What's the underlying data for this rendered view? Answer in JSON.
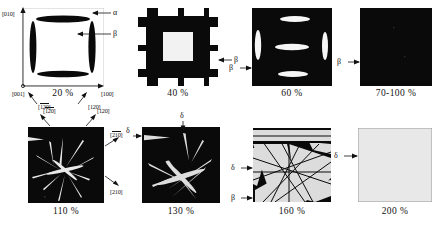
{
  "figure": {
    "background": "#ffffff",
    "ink": "#111111",
    "phase_black": "#0a0a0a",
    "phase_white": "#ffffff",
    "phase_gray": "#e8e8e8"
  },
  "panels": [
    {
      "id": "panel-20",
      "caption": "20 %",
      "pattern": "white-field-with-black-lenticular-plates",
      "axes": {
        "y_label": "[010]",
        "origin_label": "[001]",
        "x_label": "[100]"
      },
      "phase_labels": [
        {
          "symbol": "α",
          "target": "matrix"
        },
        {
          "symbol": "β",
          "target": "plate"
        }
      ],
      "direction_labels": [
        {
          "text": "120",
          "overline": true
        },
        {
          "text": "120",
          "overline": false
        }
      ]
    },
    {
      "id": "panel-40",
      "caption": "40 %",
      "pattern": "black-grid-with-white-rectangles",
      "phase_labels": [
        {
          "symbol": "β",
          "target": "matrix"
        }
      ]
    },
    {
      "id": "panel-60",
      "caption": "60 %",
      "pattern": "black-field-with-white-lenticular-plates",
      "phase_labels": [
        {
          "symbol": "β",
          "target": "matrix"
        }
      ]
    },
    {
      "id": "panel-70-100",
      "caption": "70-100 %",
      "pattern": "fully-black-field",
      "phase_labels": [
        {
          "symbol": "β",
          "target": "matrix"
        }
      ]
    },
    {
      "id": "panel-110",
      "caption": "110 %",
      "pattern": "black-field-with-thin-white-needles",
      "direction_labels": [
        {
          "text": "120",
          "overline": true
        },
        {
          "text": "120",
          "overline": false
        },
        {
          "text": "210",
          "overline": true
        },
        {
          "text": "210",
          "overline": false
        }
      ]
    },
    {
      "id": "panel-130",
      "caption": "130 %",
      "pattern": "black-field-with-broad-white-needles",
      "phase_labels": [
        {
          "symbol": "δ",
          "target": "needle-left"
        },
        {
          "symbol": "δ",
          "target": "needle-top"
        }
      ]
    },
    {
      "id": "panel-160",
      "caption": "160 %",
      "pattern": "gray-bands-crossing-on-black",
      "phase_labels": [
        {
          "symbol": "δ",
          "target": "band"
        },
        {
          "symbol": "β",
          "target": "residual-matrix"
        }
      ]
    },
    {
      "id": "panel-200",
      "caption": "200 %",
      "pattern": "uniform-light-gray-field",
      "phase_labels": [
        {
          "symbol": "δ",
          "target": "matrix"
        }
      ]
    }
  ]
}
